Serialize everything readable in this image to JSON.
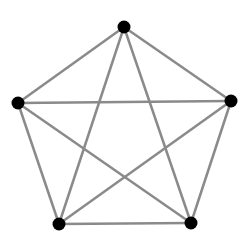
{
  "diagram": {
    "type": "complete-graph",
    "name": "K5",
    "edge_color": "#8a8a8a",
    "node_color": "#000000",
    "nodes": [
      {
        "id": "top",
        "x": 124,
        "y": 27
      },
      {
        "id": "left",
        "x": 18,
        "y": 103
      },
      {
        "id": "right",
        "x": 231,
        "y": 101
      },
      {
        "id": "bottom-left",
        "x": 59,
        "y": 224
      },
      {
        "id": "bottom-right",
        "x": 191,
        "y": 223
      }
    ],
    "edges": [
      [
        "top",
        "left"
      ],
      [
        "top",
        "right"
      ],
      [
        "top",
        "bottom-left"
      ],
      [
        "top",
        "bottom-right"
      ],
      [
        "left",
        "right"
      ],
      [
        "left",
        "bottom-left"
      ],
      [
        "left",
        "bottom-right"
      ],
      [
        "right",
        "bottom-left"
      ],
      [
        "right",
        "bottom-right"
      ],
      [
        "bottom-left",
        "bottom-right"
      ]
    ]
  }
}
